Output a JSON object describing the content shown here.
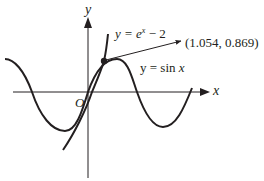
{
  "diagram": {
    "type": "function-graph",
    "axes": {
      "x_label": "x",
      "y_label": "y",
      "origin_label": "O"
    },
    "curves": [
      {
        "name": "exponential",
        "equation_prefix": "y = e",
        "equation_exp": "x",
        "equation_suffix": " − 2"
      },
      {
        "name": "sine",
        "equation_prefix": "y = sin ",
        "equation_var": "x"
      }
    ],
    "intersection": {
      "label": "(1.054, 0.869)",
      "x": 1.054,
      "y": 0.869
    },
    "colors": {
      "ink": "#231f20",
      "background": "#ffffff"
    }
  }
}
